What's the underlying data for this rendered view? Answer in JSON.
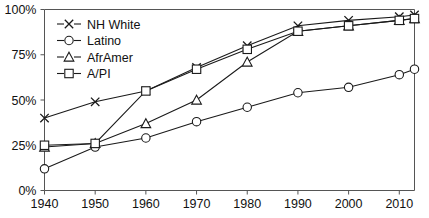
{
  "chart_data": {
    "type": "line",
    "title": "",
    "subtitle": "",
    "xlabel": "",
    "ylabel": "",
    "xlim": [
      1940,
      2013
    ],
    "ylim": [
      0,
      100
    ],
    "grid": false,
    "legend_position": "top-left inside",
    "x_tick_labels": [
      "1940",
      "1950",
      "1960",
      "1970",
      "1980",
      "1990",
      "2000",
      "2010"
    ],
    "x_ticks": [
      1940,
      1950,
      1960,
      1970,
      1980,
      1990,
      2000,
      2010
    ],
    "y_tick_labels": [
      "0%",
      "25%",
      "50%",
      "75%",
      "100%"
    ],
    "y_ticks": [
      0,
      25,
      50,
      75,
      100
    ],
    "x": [
      1940,
      1950,
      1960,
      1970,
      1980,
      1990,
      2000,
      2010,
      2013
    ],
    "series": [
      {
        "name": "NH White",
        "marker": "x",
        "values": [
          40,
          49,
          55,
          68,
          80,
          91,
          94,
          96,
          97
        ]
      },
      {
        "name": "Latino",
        "marker": "circle",
        "values": [
          12,
          24,
          29,
          38,
          46,
          54,
          57,
          64,
          67
        ]
      },
      {
        "name": "AfrAmer",
        "marker": "triangle",
        "values": [
          24,
          26,
          37,
          50,
          71,
          88,
          91,
          94,
          95
        ]
      },
      {
        "name": "A/PI",
        "marker": "square",
        "values": [
          25,
          26,
          55,
          67,
          78,
          88,
          91,
          94,
          95
        ]
      }
    ]
  },
  "legend": {
    "entries": [
      {
        "label": "NH White",
        "marker": "x-marker"
      },
      {
        "label": "Latino",
        "marker": "circle-marker"
      },
      {
        "label": "AfrAmer",
        "marker": "triangle-marker"
      },
      {
        "label": "A/PI",
        "marker": "square-marker"
      }
    ]
  },
  "colors": {
    "line": "#1a1a1a",
    "axis": "#555555",
    "marker_fill": "#ffffff",
    "background": "#ffffff"
  }
}
